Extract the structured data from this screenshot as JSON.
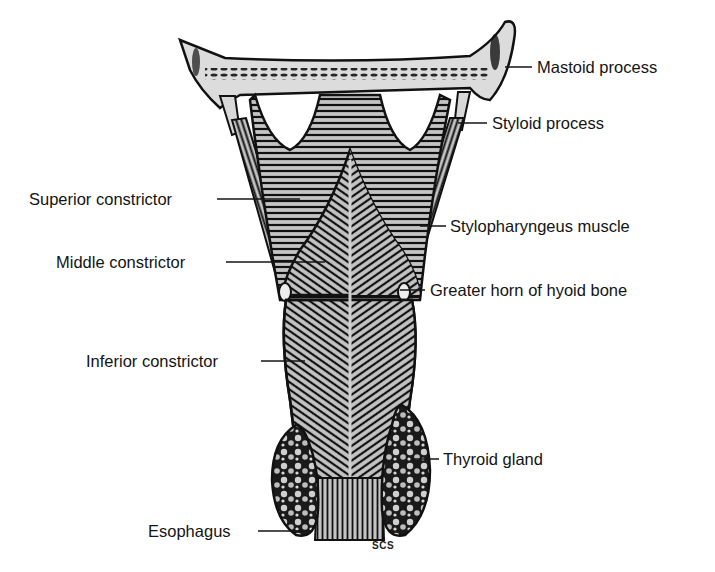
{
  "figure": {
    "signature": "SCS",
    "colors": {
      "muscle_fill": "#b8b8b8",
      "outline": "#111111",
      "bone_fill": "#d6d6d6",
      "gland_fill": "#9a9a9a",
      "background": "#ffffff"
    }
  },
  "labels": {
    "left": [
      {
        "id": "superior-constrictor",
        "text": "Superior constrictor"
      },
      {
        "id": "middle-constrictor",
        "text": "Middle constrictor"
      },
      {
        "id": "inferior-constrictor",
        "text": "Inferior constrictor"
      },
      {
        "id": "esophagus",
        "text": "Esophagus"
      }
    ],
    "right": [
      {
        "id": "mastoid-process",
        "text": "Mastoid process"
      },
      {
        "id": "styloid-process",
        "text": "Styloid process"
      },
      {
        "id": "stylopharyngeus-muscle",
        "text": "Stylopharyngeus muscle"
      },
      {
        "id": "greater-horn-hyoid",
        "text": "Greater horn of hyoid bone"
      },
      {
        "id": "thyroid-gland",
        "text": "Thyroid gland"
      }
    ]
  }
}
